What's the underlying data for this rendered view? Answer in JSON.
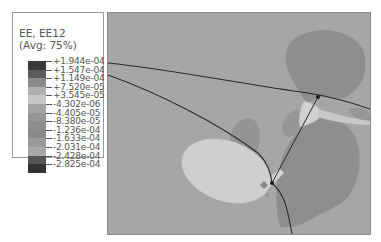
{
  "legend": {
    "title": "EE, EE12",
    "subtitle": "(Avg: 75%)",
    "entries": [
      {
        "label": "+1.944e-04",
        "color": "#3a3a3a"
      },
      {
        "label": "+1.547e-04",
        "color": "#5c5c5c"
      },
      {
        "label": "+1.149e-04",
        "color": "#8a8a8a"
      },
      {
        "label": "+7.520e-05",
        "color": "#b0b0b0"
      },
      {
        "label": "+3.545e-05",
        "color": "#c8c8c8"
      },
      {
        "label": "-4.302e-06",
        "color": "#a4a4a4"
      },
      {
        "label": "-4.405e-05",
        "color": "#969696"
      },
      {
        "label": "-8.380e-05",
        "color": "#8e8e8e"
      },
      {
        "label": "-1.236e-04",
        "color": "#8a8a8a"
      },
      {
        "label": "-1.633e-04",
        "color": "#9a9a9a"
      },
      {
        "label": "-2.031e-04",
        "color": "#a8a8a8"
      },
      {
        "label": "-2.428e-04",
        "color": "#555555"
      },
      {
        "label": "-2.825e-04",
        "color": "#333333"
      }
    ]
  },
  "chart_data": {
    "type": "heatmap",
    "title": "EE, EE12",
    "subtitle": "(Avg: 75%)",
    "variable": "EE12 (elastic shear strain component)",
    "averaging": "75%",
    "contour_levels": [
      0.0001944,
      0.0001547,
      0.0001149,
      7.52e-05,
      3.545e-05,
      -4.302e-06,
      -4.405e-05,
      -8.38e-05,
      -0.0001236,
      -0.0001633,
      -0.0002031,
      -0.0002428,
      -0.0002825
    ],
    "legend_position": "top-left",
    "grid": false,
    "colormap": "grayscale"
  },
  "plot": {
    "background": "#a6a6a6",
    "boundary_color": "#2a2a2a"
  }
}
